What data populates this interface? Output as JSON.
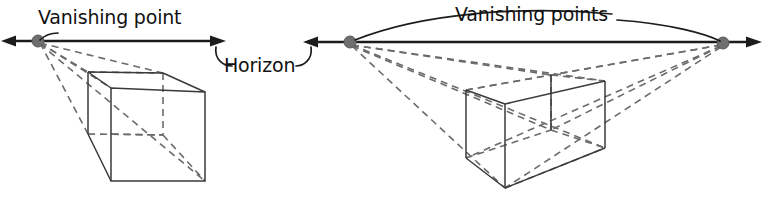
{
  "figure": {
    "background_color": "#ffffff",
    "line_color_solid": "#3a3a3a",
    "line_color_dashed": "#6b6b6b",
    "horizon_color": "#1c1c1c",
    "dot_color": "#6e6e6e",
    "text_color": "#111111"
  },
  "labels": {
    "vanishing_point_single": "Vanishing point",
    "vanishing_points_plural": "Vanishing points",
    "horizon": "Horizon"
  },
  "left_diagram": {
    "name": "one-point-perspective",
    "horizon": {
      "x1": 2,
      "y1": 41,
      "x2": 226,
      "y2": 41,
      "arrow_left": true,
      "arrow_right": true
    },
    "vanishing_points": [
      {
        "id": "vp-left",
        "x": 38,
        "y": 41,
        "r": 6
      }
    ],
    "box": {
      "front_top_left": {
        "x": 111,
        "y": 88
      },
      "front_top_right": {
        "x": 205,
        "y": 92
      },
      "front_bottom_left": {
        "x": 111,
        "y": 181
      },
      "front_bottom_right": {
        "x": 205,
        "y": 181
      },
      "back_top_left": {
        "x": 88,
        "y": 72
      },
      "back_top_right": {
        "x": 163,
        "y": 73
      },
      "back_bottom_left": {
        "x": 88,
        "y": 134
      },
      "back_bottom_right": {
        "x": 163,
        "y": 135
      }
    }
  },
  "right_diagram": {
    "name": "two-point-perspective",
    "horizon": {
      "x1": 303,
      "y1": 42,
      "x2": 762,
      "y2": 42,
      "arrow_left": true,
      "arrow_right": true
    },
    "vanishing_points": [
      {
        "id": "vp-left",
        "x": 350,
        "y": 42,
        "r": 6
      },
      {
        "id": "vp-right",
        "x": 723,
        "y": 43,
        "r": 6
      }
    ],
    "box": {
      "front_vertical_top": {
        "x": 505,
        "y": 104
      },
      "front_vertical_bottom": {
        "x": 505,
        "y": 188
      },
      "left_top": {
        "x": 466,
        "y": 90
      },
      "left_bottom": {
        "x": 466,
        "y": 158
      },
      "right_top": {
        "x": 605,
        "y": 81
      },
      "right_bottom": {
        "x": 605,
        "y": 148
      },
      "back_vertical_top": {
        "x": 551,
        "y": 75
      },
      "back_vertical_bottom": {
        "x": 551,
        "y": 130
      }
    }
  },
  "caption": {
    "bottom_text": ""
  }
}
